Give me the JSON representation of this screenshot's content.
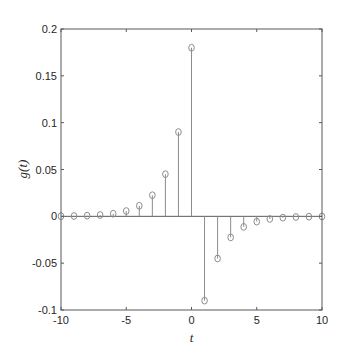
{
  "chart_data": {
    "type": "stem",
    "title": "",
    "xlabel": "t",
    "ylabel": "g(t)",
    "xlim": [
      -10,
      10
    ],
    "ylim": [
      -0.1,
      0.2
    ],
    "grid": false,
    "legend": null,
    "x_ticks": [
      -10,
      -5,
      0,
      5,
      10
    ],
    "x_tick_labels": [
      "-10",
      "-5",
      "0",
      "5",
      "10"
    ],
    "y_ticks": [
      -0.1,
      -0.05,
      0,
      0.05,
      0.1,
      0.15,
      0.2
    ],
    "y_tick_labels": [
      "-0.1",
      "-0.05",
      "0",
      "0.05",
      "0.1",
      "0.15",
      "0.2"
    ],
    "x": [
      -10,
      -9,
      -8,
      -7,
      -6,
      -5,
      -4,
      -3,
      -2,
      -1,
      0,
      1,
      2,
      3,
      4,
      5,
      6,
      7,
      8,
      9,
      10
    ],
    "values": [
      0.000176,
      0.000352,
      0.000703,
      0.001406,
      0.002813,
      0.005625,
      0.01125,
      0.0225,
      0.045,
      0.09,
      0.18,
      -0.09,
      -0.045,
      -0.0225,
      -0.01125,
      -0.005625,
      -0.002813,
      -0.001406,
      -0.000703,
      -0.000352,
      -0.000176
    ],
    "style": {
      "stem_color": "#8c8c8c",
      "marker": "circle-open",
      "marker_color": "#8c8c8c",
      "baseline_color": "#595959",
      "axes_color": "#595959"
    }
  }
}
